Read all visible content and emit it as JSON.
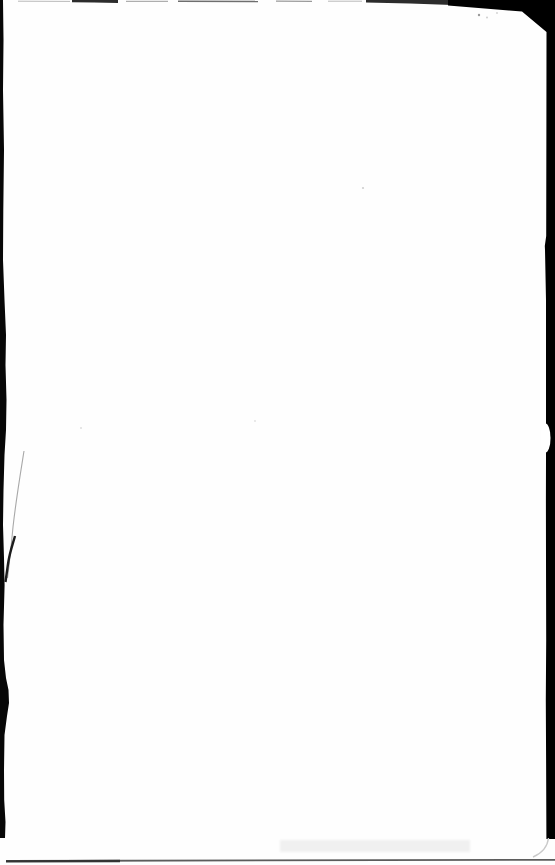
{
  "meta": {
    "kind": "scanned-blank-book-page",
    "canvas": {
      "width": 555,
      "height": 865
    }
  },
  "page": {
    "text_content": "",
    "page_number": ""
  },
  "colors": {
    "paper": "#fefefe",
    "scan_black": "#070707",
    "corner_black": "#000000",
    "top_edge_dark": "#2c2c2c",
    "top_edge_gray": "#9a9a9a",
    "top_edge_light": "#b9b9b9",
    "top_edge_medium": "#6e6e6e",
    "crease_light": "#a8a8a8",
    "crease_dark": "#1c1c1c",
    "bottom_line_dark": "#343434",
    "bottom_line_gray": "#5c5c5c",
    "smudge": "#f0f0f0",
    "speck": "#cfcfcf",
    "speck_light": "#dedede",
    "corner_arc": "#c9c9c9",
    "notch_white": "#ffffff"
  },
  "icons": {
    "left_edge": "scan-edge-left",
    "right_edge": "scan-edge-right",
    "top_edge": "scan-edge-top",
    "bottom_edge": "scan-line-bottom",
    "top_right_corner": "scan-corner-wedge",
    "notch": "page-edge-notch",
    "crease": "page-crease"
  }
}
